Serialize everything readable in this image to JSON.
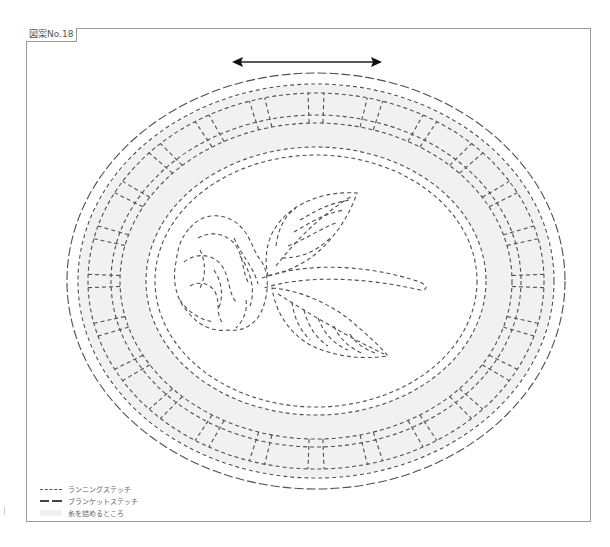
{
  "figure": {
    "label": "図案No.18",
    "direction_arrow": "horizontal double-headed arrow (grain direction)"
  },
  "design": {
    "motif": "oval frame with rose and two leaves",
    "outer_border_stitch": "blanket stitch",
    "ring_segments": 24,
    "colors": {
      "stitch_line": "#555555",
      "fill_area": "#f1f1f1",
      "frame_border": "#9a9a9a"
    }
  },
  "legend": {
    "items": [
      {
        "swatch": "dashed-short",
        "label": "ランニングステッチ"
      },
      {
        "swatch": "dashed-long",
        "label": "ブランケットステッチ"
      },
      {
        "swatch": "fill",
        "label": "糸を詰めるところ"
      }
    ]
  }
}
